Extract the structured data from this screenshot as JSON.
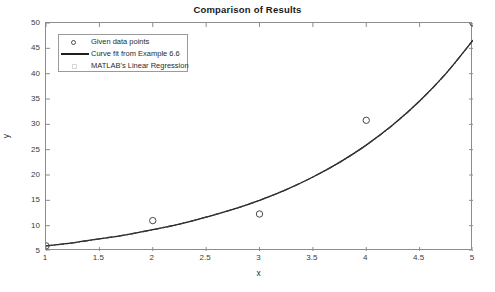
{
  "chart_data": {
    "type": "line",
    "title": "Comparison of Results",
    "xlabel": "x",
    "ylabel": "y",
    "xlim": [
      1,
      5
    ],
    "ylim": [
      5,
      50
    ],
    "grid": false,
    "legend_position": "upper-left",
    "xticks": [
      "1",
      "1.5",
      "2",
      "2.5",
      "3",
      "3.5",
      "4",
      "4.5",
      "5"
    ],
    "xtick_values": [
      1,
      1.5,
      2,
      2.5,
      3,
      3.5,
      4,
      4.5,
      5
    ],
    "yticks": [
      "5",
      "10",
      "15",
      "20",
      "25",
      "30",
      "35",
      "40",
      "45",
      "50"
    ],
    "ytick_values": [
      5,
      10,
      15,
      20,
      25,
      30,
      35,
      40,
      45,
      50
    ],
    "series": [
      {
        "name": "Given data points",
        "style": "marker-circle",
        "marker": "o",
        "color": "#4a4a4a",
        "x": [
          1,
          2,
          3,
          4,
          5
        ],
        "y": [
          6.0,
          11.0,
          12.3,
          30.8,
          50.0
        ]
      },
      {
        "name": "Curve fit from Example 6.6",
        "style": "solid-line",
        "color": "#1f1f1f",
        "x": [
          1,
          1.25,
          1.5,
          1.75,
          2,
          2.25,
          2.5,
          2.75,
          3,
          3.25,
          3.5,
          3.75,
          4,
          4.25,
          4.5,
          4.75,
          5
        ],
        "y": [
          6.0,
          6.6,
          7.4,
          8.2,
          9.2,
          10.3,
          11.7,
          13.2,
          15.0,
          17.1,
          19.6,
          22.5,
          25.9,
          29.9,
          34.6,
          40.1,
          46.6
        ]
      },
      {
        "name": "MATLAB's Linear Regression",
        "style": "dash-dot-line",
        "color": "#3a3a3a",
        "x": [
          1,
          1.25,
          1.5,
          1.75,
          2,
          2.25,
          2.5,
          2.75,
          3,
          3.25,
          3.5,
          3.75,
          4,
          4.25,
          4.5,
          4.75,
          5
        ],
        "y": [
          6.0,
          6.6,
          7.4,
          8.2,
          9.2,
          10.3,
          11.7,
          13.2,
          15.0,
          17.1,
          19.6,
          22.5,
          25.9,
          29.9,
          34.6,
          40.1,
          46.6
        ]
      }
    ]
  },
  "legend": {
    "entries": [
      {
        "label": "Given data points"
      },
      {
        "label": "Curve fit from Example 6.6"
      },
      {
        "label": "MATLAB's Linear Regression"
      }
    ]
  },
  "colors": {
    "axis": "#8c8c8c",
    "text": "#2b2b2b",
    "curve": "#1f1f1f",
    "marker": "#4a4a4a",
    "background": "#ffffff"
  }
}
